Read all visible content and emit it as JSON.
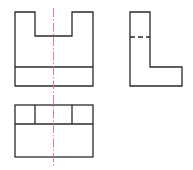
{
  "drawing": {
    "title": "Orthographic projection of U-notched block",
    "colors": {
      "outline": "#2a2a2a",
      "centerline": "#e0707a",
      "hidden": "#2a2a2a",
      "background": "#ffffff"
    },
    "views": [
      {
        "name": "front-view",
        "label": ""
      },
      {
        "name": "side-view",
        "label": ""
      },
      {
        "name": "top-view",
        "label": ""
      }
    ]
  }
}
